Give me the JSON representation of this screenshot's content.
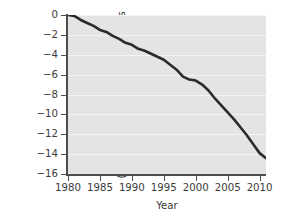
{
  "chart_data": {
    "type": "line",
    "title": "",
    "subtitle": "",
    "xlabel": "Year",
    "ylabel": "Mean cumulative mass of ice (water equivalent) lost, in meters",
    "ylabel_line_1": "Mean cumulative mass of ice",
    "ylabel_line_2": "(water equivalent) lost, in meters",
    "xlim": [
      1980,
      2011
    ],
    "ylim": [
      -16,
      0
    ],
    "xticks": [
      1980,
      1985,
      1990,
      1995,
      2000,
      2005,
      2010
    ],
    "xtick_labels": [
      "1980",
      "1985",
      "1990",
      "1995",
      "2000",
      "2005",
      "2010"
    ],
    "yticks": [
      0,
      -2,
      -4,
      -6,
      -8,
      -10,
      -12,
      -14,
      -16
    ],
    "ytick_labels": [
      "0",
      "−2",
      "−4",
      "−6",
      "−8",
      "−10",
      "−12",
      "−14",
      "−16"
    ],
    "grid": true,
    "grid_orientation": "horizontal",
    "grid_color": "#f4f4f4",
    "plot_background": "#e4e4e4",
    "line_color": "#2b2b2b",
    "line_width": 2.6,
    "legend": null,
    "legend_position": "none",
    "series": [
      {
        "name": "Mean cumulative mass balance of reference glaciers",
        "x": [
          1980,
          1981,
          1982,
          1983,
          1984,
          1985,
          1986,
          1987,
          1988,
          1989,
          1990,
          1991,
          1992,
          1993,
          1994,
          1995,
          1996,
          1997,
          1998,
          1999,
          2000,
          2001,
          2002,
          2003,
          2004,
          2005,
          2006,
          2007,
          2008,
          2009,
          2010,
          2011
        ],
        "values": [
          0.0,
          -0.1,
          -0.5,
          -0.8,
          -1.1,
          -1.5,
          -1.7,
          -2.1,
          -2.4,
          -2.8,
          -3.0,
          -3.4,
          -3.6,
          -3.9,
          -4.2,
          -4.5,
          -5.0,
          -5.5,
          -6.2,
          -6.5,
          -6.6,
          -7.0,
          -7.6,
          -8.4,
          -9.1,
          -9.8,
          -10.5,
          -11.3,
          -12.1,
          -13.0,
          -13.9,
          -14.4
        ]
      }
    ]
  },
  "axis": {
    "x_title": "Year"
  }
}
